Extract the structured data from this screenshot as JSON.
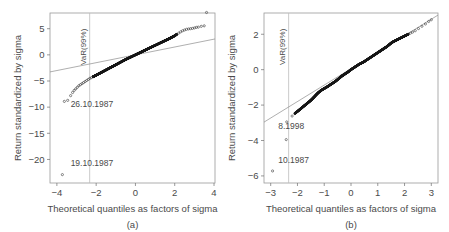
{
  "figure": {
    "background": "#ffffff",
    "frame_color": "#9a9a9a",
    "point_color": "#1a1a1a",
    "refline_color": "#8d8d8d",
    "vline_color": "#bdbdbd"
  },
  "chart_data": [
    {
      "type": "scatter",
      "id": "panel-a",
      "title": "",
      "caption": "(a)",
      "xlabel": "Theoretical quantiles as factors of sigma",
      "ylabel": "Return standardized by sigma",
      "xlim": [
        -4.35,
        4.05
      ],
      "ylim": [
        -24.5,
        8.0
      ],
      "xticks": [
        -4,
        -2,
        0,
        2,
        4
      ],
      "xtick_labels": [
        "−4",
        "−2",
        "0",
        "2",
        "4"
      ],
      "yticks": [
        5,
        0,
        -5,
        -10,
        -15,
        -20
      ],
      "ytick_labels": [
        "5",
        "0",
        "−5",
        "−10",
        "−15",
        "−20"
      ],
      "grid": false,
      "legend": null,
      "annotations": [
        {
          "name": "var-line-label",
          "text": "VaR(99%)",
          "x": -2.33,
          "orientation": "vertical"
        },
        {
          "name": "outlier-label-1",
          "text": "26.10.1987",
          "x": -3.3,
          "y": -10.0
        },
        {
          "name": "outlier-label-2",
          "text": "19.10.1987",
          "x": -3.3,
          "y": -21.2
        }
      ],
      "vline": {
        "x": -2.33,
        "label": "VaR(99%)"
      },
      "reference_line": {
        "slope": 0.75,
        "intercept": 0.0,
        "from_x": -4.35,
        "to_x": 4.05
      },
      "outliers": [
        {
          "x": -3.72,
          "y": -22.9,
          "label": "19.10.1987"
        },
        {
          "x": -3.45,
          "y": -8.7,
          "label": "26.10.1987"
        },
        {
          "x": -3.62,
          "y": -8.9,
          "label": ""
        },
        {
          "x": 3.62,
          "y": 8.1,
          "label": ""
        }
      ],
      "points": [
        [
          -3.72,
          -22.9
        ],
        [
          -3.62,
          -8.9
        ],
        [
          -3.45,
          -8.7
        ],
        [
          -3.3,
          -7.8
        ],
        [
          -3.2,
          -7.2
        ],
        [
          -3.12,
          -6.8
        ],
        [
          -3.04,
          -6.5
        ],
        [
          -2.96,
          -6.2
        ],
        [
          -2.88,
          -5.9
        ],
        [
          -2.8,
          -5.7
        ],
        [
          -2.72,
          -5.5
        ],
        [
          -2.64,
          -5.3
        ],
        [
          -2.56,
          -5.1
        ],
        [
          -2.48,
          -4.9
        ],
        [
          -2.4,
          -4.7
        ],
        [
          -2.32,
          -4.5
        ],
        [
          -2.24,
          -4.35
        ],
        [
          -2.16,
          -4.2
        ],
        [
          -2.08,
          -4.05
        ],
        [
          -2.0,
          -3.9
        ],
        [
          -1.9,
          -3.7
        ],
        [
          -1.8,
          -3.5
        ],
        [
          -1.7,
          -3.3
        ],
        [
          -1.6,
          -3.1
        ],
        [
          -1.5,
          -2.9
        ],
        [
          -1.4,
          -2.7
        ],
        [
          -1.3,
          -2.5
        ],
        [
          -1.2,
          -2.3
        ],
        [
          -1.1,
          -2.1
        ],
        [
          -1.0,
          -1.9
        ],
        [
          -0.9,
          -1.7
        ],
        [
          -0.8,
          -1.5
        ],
        [
          -0.7,
          -1.3
        ],
        [
          -0.6,
          -1.1
        ],
        [
          -0.5,
          -0.9
        ],
        [
          -0.4,
          -0.72
        ],
        [
          -0.3,
          -0.54
        ],
        [
          -0.2,
          -0.36
        ],
        [
          -0.1,
          -0.18
        ],
        [
          0.0,
          0.0
        ],
        [
          0.1,
          0.18
        ],
        [
          0.2,
          0.36
        ],
        [
          0.3,
          0.54
        ],
        [
          0.4,
          0.72
        ],
        [
          0.5,
          0.9
        ],
        [
          0.6,
          1.08
        ],
        [
          0.7,
          1.26
        ],
        [
          0.8,
          1.44
        ],
        [
          0.9,
          1.62
        ],
        [
          1.0,
          1.8
        ],
        [
          1.1,
          1.98
        ],
        [
          1.2,
          2.16
        ],
        [
          1.3,
          2.34
        ],
        [
          1.4,
          2.52
        ],
        [
          1.5,
          2.7
        ],
        [
          1.6,
          2.88
        ],
        [
          1.7,
          3.06
        ],
        [
          1.8,
          3.25
        ],
        [
          1.9,
          3.45
        ],
        [
          2.0,
          3.65
        ],
        [
          2.1,
          3.9
        ],
        [
          2.2,
          4.15
        ],
        [
          2.3,
          4.4
        ],
        [
          2.4,
          4.6
        ],
        [
          2.5,
          4.75
        ],
        [
          2.6,
          4.88
        ],
        [
          2.7,
          4.95
        ],
        [
          2.8,
          5.0
        ],
        [
          2.9,
          5.05
        ],
        [
          3.0,
          5.15
        ],
        [
          3.1,
          5.25
        ],
        [
          3.2,
          5.3
        ],
        [
          3.35,
          5.45
        ],
        [
          3.5,
          5.55
        ],
        [
          3.62,
          8.1
        ]
      ]
    },
    {
      "type": "scatter",
      "id": "panel-b",
      "title": "",
      "caption": "(b)",
      "xlabel": "Theoretical quantiles as factors of sigma",
      "ylabel": "Return standardized by sigma",
      "xlim": [
        -3.25,
        3.25
      ],
      "ylim": [
        -6.4,
        3.2
      ],
      "xticks": [
        -3,
        -2,
        -1,
        0,
        1,
        2,
        3
      ],
      "xtick_labels": [
        "−3",
        "−2",
        "−1",
        "0",
        "1",
        "2",
        "3"
      ],
      "yticks": [
        2,
        0,
        -2,
        -4,
        -6
      ],
      "ytick_labels": [
        "2",
        "0",
        "−2",
        "−4",
        "−6"
      ],
      "grid": false,
      "legend": null,
      "annotations": [
        {
          "name": "var-line-label",
          "text": "VaR(99%)",
          "x": -2.33,
          "orientation": "vertical"
        },
        {
          "name": "outlier-label-1",
          "text": "8.1998",
          "x": -2.72,
          "y": -3.35
        },
        {
          "name": "outlier-label-2",
          "text": "10.1987",
          "x": -2.72,
          "y": -5.25
        }
      ],
      "vline": {
        "x": -2.33,
        "label": "VaR(99%)"
      },
      "reference_line": {
        "slope": 0.93,
        "intercept": 0.06,
        "from_x": -3.25,
        "to_x": 3.25
      },
      "outliers": [
        {
          "x": -2.93,
          "y": -5.72,
          "label": "10.1987"
        },
        {
          "x": -2.42,
          "y": -3.95,
          "label": "8.1998"
        },
        {
          "x": -2.4,
          "y": -2.95,
          "label": ""
        }
      ],
      "points": [
        [
          -2.93,
          -5.72
        ],
        [
          -2.42,
          -3.95
        ],
        [
          -2.4,
          -2.95
        ],
        [
          -2.2,
          -2.62
        ],
        [
          -2.1,
          -2.48
        ],
        [
          -2.0,
          -2.36
        ],
        [
          -1.92,
          -2.26
        ],
        [
          -1.84,
          -2.16
        ],
        [
          -1.76,
          -2.06
        ],
        [
          -1.68,
          -1.96
        ],
        [
          -1.6,
          -1.86
        ],
        [
          -1.52,
          -1.76
        ],
        [
          -1.45,
          -1.66
        ],
        [
          -1.38,
          -1.55
        ],
        [
          -1.3,
          -1.42
        ],
        [
          -1.22,
          -1.3
        ],
        [
          -1.14,
          -1.2
        ],
        [
          -1.06,
          -1.12
        ],
        [
          -0.98,
          -1.05
        ],
        [
          -0.9,
          -0.98
        ],
        [
          -0.82,
          -0.9
        ],
        [
          -0.74,
          -0.82
        ],
        [
          -0.66,
          -0.74
        ],
        [
          -0.58,
          -0.66
        ],
        [
          -0.5,
          -0.56
        ],
        [
          -0.42,
          -0.46
        ],
        [
          -0.34,
          -0.36
        ],
        [
          -0.26,
          -0.28
        ],
        [
          -0.18,
          -0.2
        ],
        [
          -0.1,
          -0.12
        ],
        [
          -0.02,
          -0.02
        ],
        [
          0.06,
          0.06
        ],
        [
          0.14,
          0.14
        ],
        [
          0.22,
          0.22
        ],
        [
          0.3,
          0.3
        ],
        [
          0.38,
          0.36
        ],
        [
          0.46,
          0.42
        ],
        [
          0.54,
          0.5
        ],
        [
          0.62,
          0.58
        ],
        [
          0.7,
          0.66
        ],
        [
          0.78,
          0.74
        ],
        [
          0.86,
          0.82
        ],
        [
          0.94,
          0.9
        ],
        [
          1.02,
          0.98
        ],
        [
          1.1,
          1.06
        ],
        [
          1.18,
          1.14
        ],
        [
          1.26,
          1.22
        ],
        [
          1.34,
          1.3
        ],
        [
          1.42,
          1.4
        ],
        [
          1.5,
          1.5
        ],
        [
          1.58,
          1.58
        ],
        [
          1.66,
          1.64
        ],
        [
          1.74,
          1.7
        ],
        [
          1.82,
          1.76
        ],
        [
          1.9,
          1.82
        ],
        [
          1.98,
          1.88
        ],
        [
          2.06,
          1.94
        ],
        [
          2.14,
          2.0
        ],
        [
          2.22,
          2.06
        ],
        [
          2.3,
          2.12
        ],
        [
          2.4,
          2.2
        ],
        [
          2.52,
          2.32
        ],
        [
          2.65,
          2.45
        ],
        [
          2.78,
          2.58
        ],
        [
          2.9,
          2.72
        ],
        [
          3.0,
          2.82
        ]
      ]
    }
  ]
}
